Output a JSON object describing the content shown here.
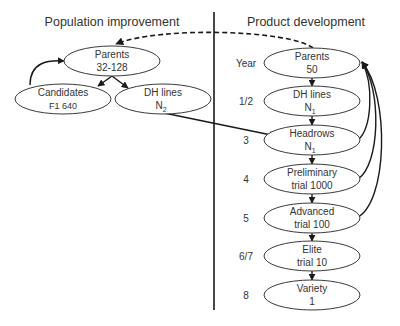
{
  "titles": {
    "left": "Population improvement",
    "right": "Product development"
  },
  "year_header": "Year",
  "population": {
    "parents": {
      "label": "Parents",
      "value": "32-128"
    },
    "candidates": {
      "label": "Candidates",
      "value": "F1 640"
    },
    "dh_lines": {
      "label": "DH lines",
      "value": "N",
      "subscript": "2"
    }
  },
  "product": {
    "stages": [
      {
        "year": "",
        "label": "Parents",
        "value": "50",
        "subscript": ""
      },
      {
        "year": "1/2",
        "label": "DH lines",
        "value": "N",
        "subscript": "1"
      },
      {
        "year": "3",
        "label": "Headrows",
        "value": "N",
        "subscript": "1"
      },
      {
        "year": "4",
        "label": "Preliminary",
        "value": "trial 1000",
        "subscript": ""
      },
      {
        "year": "5",
        "label": "Advanced",
        "value": "trial 100",
        "subscript": ""
      },
      {
        "year": "6/7",
        "label": "Elite",
        "value": "trial 10",
        "subscript": ""
      },
      {
        "year": "8",
        "label": "Variety",
        "value": "1",
        "subscript": ""
      }
    ]
  },
  "colors": {
    "stroke": "#1a1a1a",
    "text": "#333333",
    "background": "#ffffff"
  }
}
